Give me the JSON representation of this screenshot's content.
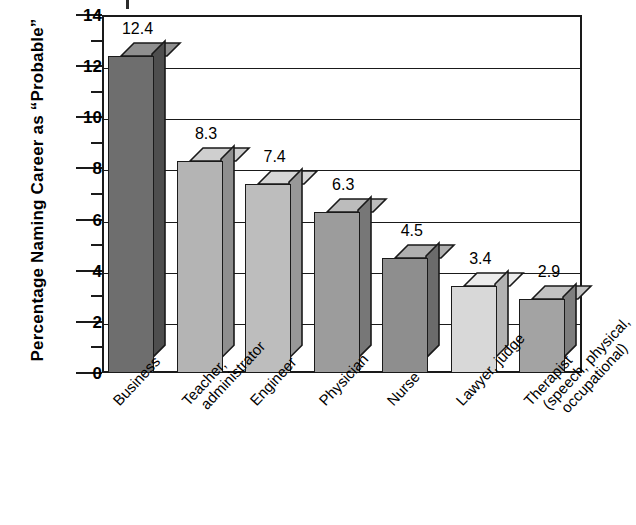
{
  "chart_data": {
    "type": "bar",
    "title": "",
    "xlabel": "",
    "ylabel": "Percentage Naming Career as “Probable”",
    "ylim": [
      0,
      14
    ],
    "ytick_step": 2,
    "grid": true,
    "legend": "none",
    "categories": [
      "Business",
      "Teacher, administrator",
      "Engineer",
      "Physician",
      "Nurse",
      "Lawyer, judge",
      "Therapist (speech, physical, occupational)"
    ],
    "values": [
      12.4,
      8.3,
      7.4,
      6.3,
      4.5,
      3.4,
      2.9
    ],
    "value_labels": [
      "12.4",
      "8.3",
      "7.4",
      "6.3",
      "4.5",
      "3.4",
      "2.9"
    ],
    "ytick_labels": [
      "0",
      "2",
      "4",
      "6",
      "8",
      "10",
      "12",
      "14"
    ],
    "bar_colors": [
      "#6e6e6e",
      "#b4b4b4",
      "#bdbdbd",
      "#9c9c9c",
      "#8e8e8e",
      "#d8d8d8",
      "#a3a3a3"
    ],
    "bar_top_colors": [
      "#8f8f8f",
      "#cfcfcf",
      "#d6d6d6",
      "#bcbcbc",
      "#afafaf",
      "#ececec",
      "#c2c2c2"
    ],
    "bar_side_colors": [
      "#4e4e4e",
      "#8f8f8f",
      "#989898",
      "#777777",
      "#6b6b6b",
      "#b2b2b2",
      "#7e7e7e"
    ]
  },
  "axis": {
    "y_title": "Percentage Naming Career as “Probable”"
  },
  "x_label_lines": [
    [
      "Business"
    ],
    [
      "Teacher,",
      "administrator"
    ],
    [
      "Engineer"
    ],
    [
      "Physician"
    ],
    [
      "Nurse"
    ],
    [
      "Lawyer, judge"
    ],
    [
      "Therapist",
      "(speech, physical,",
      "occupational)"
    ]
  ],
  "colors": {
    "axis": "#1a1a1a",
    "background": "#ffffff",
    "text": "#000000"
  }
}
